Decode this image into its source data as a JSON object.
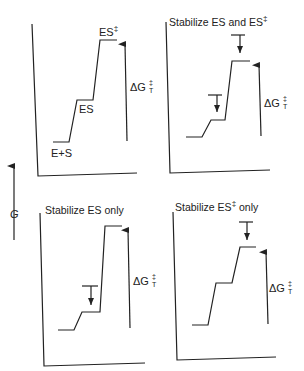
{
  "y_axis_label": "G",
  "panels": [
    {
      "id": "reference",
      "title": "",
      "levels": {
        "es_plus_s": "E+S",
        "es": "ES",
        "transition_state": "ES",
        "ts_superscript": "‡"
      },
      "delta_label": {
        "symbol": "ΔG",
        "superscript": "‡",
        "subscript": "T"
      }
    },
    {
      "id": "stabilize-both",
      "title": "Stabilize ES and ES",
      "title_superscript": "‡",
      "delta_label": {
        "symbol": "ΔG",
        "superscript": "‡",
        "subscript": "T"
      }
    },
    {
      "id": "stabilize-es-only",
      "title": "Stabilize ES only",
      "title_superscript": "",
      "delta_label": {
        "symbol": "ΔG",
        "superscript": "‡",
        "subscript": "T"
      }
    },
    {
      "id": "stabilize-ts-only",
      "title_pre": "Stabilize ES",
      "title_superscript": "‡",
      "title_post": " only",
      "delta_label": {
        "symbol": "ΔG",
        "superscript": "‡",
        "subscript": "T"
      }
    }
  ],
  "colors": {
    "ink": "#222222",
    "background": "#ffffff"
  }
}
